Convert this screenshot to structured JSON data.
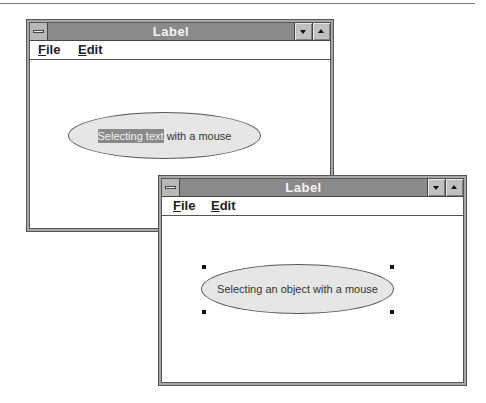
{
  "windows": [
    {
      "title": "Label",
      "menu": [
        {
          "accel": "F",
          "rest": "ile",
          "label": "File"
        },
        {
          "accel": "E",
          "rest": "dit",
          "label": "Edit"
        }
      ],
      "label_object": {
        "selected_text": "Selecting text",
        "unselected_text": " with a mouse",
        "full_text": "Selecting text with a mouse"
      }
    },
    {
      "title": "Label",
      "menu": [
        {
          "accel": "F",
          "rest": "ile",
          "label": "File"
        },
        {
          "accel": "E",
          "rest": "dit",
          "label": "Edit"
        }
      ],
      "label_object": {
        "text": "Selecting an object with a mouse",
        "selected": true
      }
    }
  ],
  "colors": {
    "titlebar": "#8a8a8a",
    "ellipse_fill": "#e6e6e6",
    "text_selection": "#8a8a8a"
  }
}
